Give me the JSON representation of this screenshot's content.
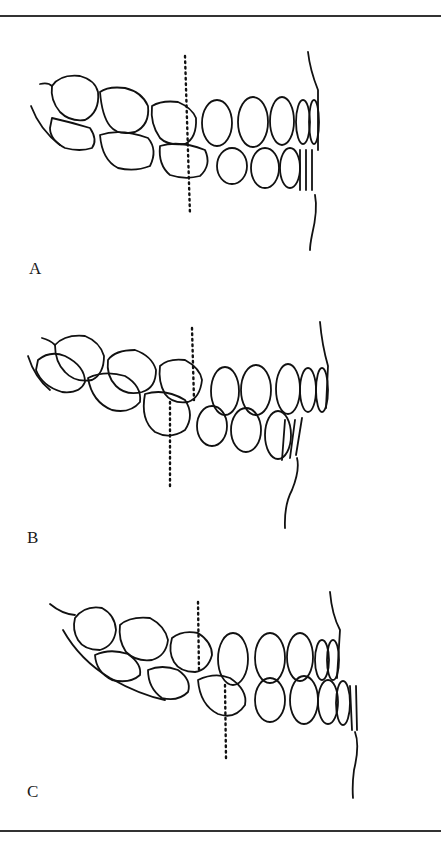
{
  "figure": {
    "panels": [
      {
        "label": "A",
        "description": "Lateral view of dentition, upper and lower molars aligned; dotted vertical reference line continuous through both arches"
      },
      {
        "label": "B",
        "description": "Lateral view of dentition, lower arch shifted distally; dotted reference lines offset (upper right of lower)"
      },
      {
        "label": "C",
        "description": "Lateral view of dentition, lower arch shifted mesially; dotted reference lines offset (lower right of upper)"
      }
    ]
  }
}
